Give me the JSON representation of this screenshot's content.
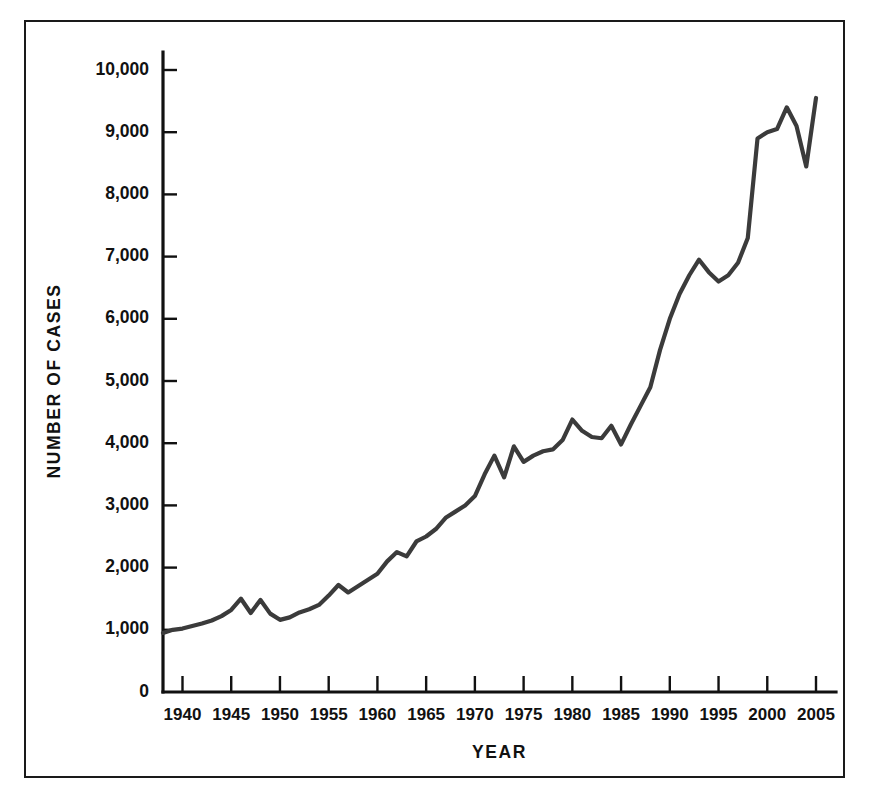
{
  "chart_data": {
    "type": "line",
    "title": "",
    "xlabel": "YEAR",
    "ylabel": "NUMBER OF CASES",
    "xlim": [
      1938,
      2005
    ],
    "ylim": [
      0,
      10000
    ],
    "grid": false,
    "legend": false,
    "line_color": "#3b3b3b",
    "x_tick_labels": [
      "1940",
      "1945",
      "1950",
      "1955",
      "1960",
      "1965",
      "1970",
      "1975",
      "1980",
      "1985",
      "1990",
      "1995",
      "2000",
      "2005"
    ],
    "x_tick_values": [
      1940,
      1945,
      1950,
      1955,
      1960,
      1965,
      1970,
      1975,
      1980,
      1985,
      1990,
      1995,
      2000,
      2005
    ],
    "y_tick_labels": [
      "0",
      "1,000",
      "2,000",
      "3,000",
      "4,000",
      "5,000",
      "6,000",
      "7,000",
      "8,000",
      "9,000",
      "10,000"
    ],
    "y_tick_values": [
      0,
      1000,
      2000,
      3000,
      4000,
      5000,
      6000,
      7000,
      8000,
      9000,
      10000
    ],
    "series": [
      {
        "name": "Number of cases",
        "x": [
          1938,
          1939,
          1940,
          1941,
          1942,
          1943,
          1944,
          1945,
          1946,
          1947,
          1948,
          1949,
          1950,
          1951,
          1952,
          1953,
          1954,
          1955,
          1956,
          1957,
          1958,
          1959,
          1960,
          1961,
          1962,
          1963,
          1964,
          1965,
          1966,
          1967,
          1968,
          1969,
          1970,
          1971,
          1972,
          1973,
          1974,
          1975,
          1976,
          1977,
          1978,
          1979,
          1980,
          1981,
          1982,
          1983,
          1984,
          1985,
          1986,
          1987,
          1988,
          1989,
          1990,
          1991,
          1992,
          1993,
          1994,
          1995,
          1996,
          1997,
          1998,
          1999,
          2000,
          2001,
          2002,
          2003,
          2004,
          2005
        ],
        "values": [
          950,
          1000,
          1020,
          1060,
          1100,
          1150,
          1220,
          1320,
          1500,
          1270,
          1480,
          1260,
          1160,
          1200,
          1280,
          1330,
          1400,
          1550,
          1720,
          1600,
          1700,
          1800,
          1900,
          2100,
          2250,
          2180,
          2420,
          2500,
          2620,
          2800,
          2900,
          3000,
          3150,
          3500,
          3800,
          3450,
          3950,
          3700,
          3800,
          3870,
          3900,
          4050,
          4380,
          4200,
          4100,
          4080,
          4280,
          3980,
          4300,
          4600,
          4900,
          5500,
          6000,
          6400,
          6700,
          6950,
          6750,
          6600,
          6700,
          6900,
          7300,
          8900,
          9000,
          9050,
          9400,
          9100,
          8450,
          9550
        ]
      }
    ]
  },
  "axes": {
    "y_axis_title": "NUMBER OF CASES",
    "x_axis_title": "YEAR"
  }
}
